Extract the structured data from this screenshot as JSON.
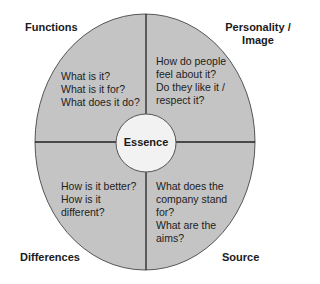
{
  "diagram": {
    "type": "quadrant-circle",
    "colors": {
      "fill": "#c4c4c4",
      "outline": "#555555",
      "divider": "#222222",
      "center_fill": "#f2f2f2"
    },
    "center": {
      "label": "Essence"
    },
    "quadrants": [
      {
        "position": "top-left",
        "label": "Functions",
        "questions": [
          "What is it?",
          "What is it for?",
          "What does it do?"
        ]
      },
      {
        "position": "top-right",
        "label": "Personality / Image",
        "label_lines": [
          "Personality /",
          "Image"
        ],
        "questions": [
          "How do people",
          "feel about it?",
          "Do they like it /",
          "respect it?"
        ]
      },
      {
        "position": "bottom-left",
        "label": "Differences",
        "questions": [
          "How is it better?",
          "How is it",
          "different?"
        ]
      },
      {
        "position": "bottom-right",
        "label": "Source",
        "questions": [
          "What does the",
          "company stand",
          "for?",
          "What are the",
          "aims?"
        ]
      }
    ]
  }
}
